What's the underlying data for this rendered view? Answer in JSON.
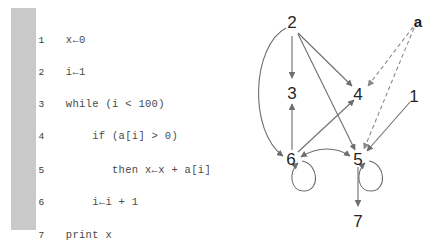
{
  "code": {
    "lines": [
      {
        "number": "1",
        "text": "x←0"
      },
      {
        "number": "2",
        "text": "i←1"
      },
      {
        "number": "3",
        "text": "while (i < 100)"
      },
      {
        "number": "4",
        "text": "    if (a[i] > 0)"
      },
      {
        "number": "5",
        "text": "       then x←x + a[i]"
      },
      {
        "number": "6",
        "text": "    i←i + 1"
      },
      {
        "number": "7",
        "text": "print x"
      }
    ],
    "gutter_color": "#c9c9c9"
  },
  "graph": {
    "nodes": [
      {
        "id": "n2",
        "label": "2",
        "x": 292,
        "y": 28
      },
      {
        "id": "n3",
        "label": "3",
        "x": 292,
        "y": 93
      },
      {
        "id": "n4",
        "label": "4",
        "x": 358,
        "y": 94
      },
      {
        "id": "n6",
        "label": "6",
        "x": 291,
        "y": 159
      },
      {
        "id": "n5",
        "label": "5",
        "x": 358,
        "y": 159
      },
      {
        "id": "n7",
        "label": "7",
        "x": 358,
        "y": 221
      },
      {
        "id": "n1",
        "label": "1",
        "x": 414,
        "y": 96
      },
      {
        "id": "na",
        "label": "a",
        "x": 418,
        "y": 22,
        "bold": true
      }
    ],
    "edges": [
      {
        "from": "2",
        "to": "3",
        "style": "solid",
        "shape": "straight"
      },
      {
        "from": "2",
        "to": "4",
        "style": "solid",
        "shape": "straight"
      },
      {
        "from": "2",
        "to": "5",
        "style": "solid",
        "shape": "straight"
      },
      {
        "from": "2",
        "to": "6",
        "style": "solid",
        "shape": "curved"
      },
      {
        "from": "6",
        "to": "3",
        "style": "solid",
        "shape": "straight"
      },
      {
        "from": "6",
        "to": "4",
        "style": "solid",
        "shape": "straight"
      },
      {
        "from": "6",
        "to": "5",
        "style": "solid",
        "shape": "curved",
        "bidirectional": true
      },
      {
        "from": "6",
        "to": "6",
        "style": "solid",
        "shape": "self-loop"
      },
      {
        "from": "5",
        "to": "5",
        "style": "solid",
        "shape": "self-loop"
      },
      {
        "from": "5",
        "to": "7",
        "style": "solid",
        "shape": "straight"
      },
      {
        "from": "1",
        "to": "5",
        "style": "solid",
        "shape": "straight"
      },
      {
        "from": "a",
        "to": "4",
        "style": "dashed",
        "shape": "straight"
      },
      {
        "from": "a",
        "to": "5",
        "style": "dashed",
        "shape": "straight"
      }
    ],
    "edge_color": "#6e6e6e",
    "dashed_edge_color": "#8a8a8a"
  }
}
